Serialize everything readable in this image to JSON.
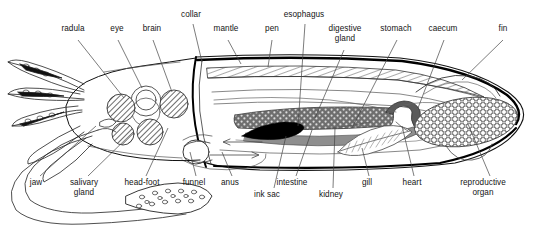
{
  "figure": {
    "type": "labeled-anatomical-diagram",
    "view": "lateral cutaway",
    "background_color": "#ffffff",
    "line_color": "#141414",
    "ink_sac_color": "#000000",
    "digestive_gland_color": "#6b6b6b",
    "intestine_color": "#8a8a8a"
  },
  "labels": {
    "top": [
      {
        "id": "radula",
        "text": "radula",
        "x": 73,
        "y": 28,
        "lines": [
          "radula"
        ]
      },
      {
        "id": "eye",
        "text": "eye",
        "x": 117,
        "y": 28,
        "lines": [
          "eye"
        ]
      },
      {
        "id": "brain",
        "text": "brain",
        "x": 152,
        "y": 28,
        "lines": [
          "brain"
        ]
      },
      {
        "id": "collar",
        "text": "collar",
        "x": 191,
        "y": 14,
        "lines": [
          "collar"
        ]
      },
      {
        "id": "mantle",
        "text": "mantle",
        "x": 226,
        "y": 28,
        "lines": [
          "mantle"
        ]
      },
      {
        "id": "pen",
        "text": "pen",
        "x": 272,
        "y": 28,
        "lines": [
          "pen"
        ]
      },
      {
        "id": "esophagus",
        "text": "esophagus",
        "x": 304,
        "y": 14,
        "lines": [
          "esophagus"
        ]
      },
      {
        "id": "digestive-gland",
        "text": "digestive gland",
        "x": 345,
        "y": 28,
        "lines": [
          "digestive",
          "gland"
        ]
      },
      {
        "id": "stomach",
        "text": "stomach",
        "x": 396,
        "y": 28,
        "lines": [
          "stomach"
        ]
      },
      {
        "id": "caecum",
        "text": "caecum",
        "x": 443,
        "y": 28,
        "lines": [
          "caecum"
        ]
      },
      {
        "id": "fin",
        "text": "fin",
        "x": 503,
        "y": 28,
        "lines": [
          "fin"
        ]
      }
    ],
    "bottom": [
      {
        "id": "jaw",
        "text": "jaw",
        "x": 36,
        "y": 182,
        "lines": [
          "jaw"
        ]
      },
      {
        "id": "salivary-gland",
        "text": "salivary gland",
        "x": 84,
        "y": 182,
        "lines": [
          "salivary",
          "gland"
        ]
      },
      {
        "id": "head-foot",
        "text": "head-foot",
        "x": 142,
        "y": 182,
        "lines": [
          "head-foot"
        ]
      },
      {
        "id": "funnel",
        "text": "funnel",
        "x": 194,
        "y": 182,
        "lines": [
          "funnel"
        ]
      },
      {
        "id": "anus",
        "text": "anus",
        "x": 230,
        "y": 182,
        "lines": [
          "anus"
        ]
      },
      {
        "id": "ink-sac",
        "text": "ink sac",
        "x": 267,
        "y": 194,
        "lines": [
          "ink sac"
        ]
      },
      {
        "id": "intestine",
        "text": "intestine",
        "x": 290,
        "y": 182,
        "lines": [
          "intestine"
        ]
      },
      {
        "id": "kidney",
        "text": "kidney",
        "x": 331,
        "y": 194,
        "lines": [
          "kidney"
        ]
      },
      {
        "id": "gill",
        "text": "gill",
        "x": 367,
        "y": 182,
        "lines": [
          "gill"
        ]
      },
      {
        "id": "heart",
        "text": "heart",
        "x": 412,
        "y": 182,
        "lines": [
          "heart"
        ]
      },
      {
        "id": "reproductive-organ",
        "text": "reproductive organ",
        "x": 483,
        "y": 182,
        "lines": [
          "reproductive",
          "organ"
        ]
      }
    ]
  }
}
